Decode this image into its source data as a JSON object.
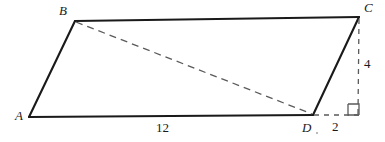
{
  "figure": {
    "type": "geometry-diagram",
    "shape": "quadrilateral",
    "canvas": {
      "width": 385,
      "height": 142
    },
    "background_color": "#ffffff",
    "stroke_color": "#1a1a1a",
    "dash_color": "#5a5a5a"
  },
  "vertices": {
    "A": {
      "label": "A",
      "x": 29,
      "y": 117,
      "label_x": 15,
      "label_y": 110
    },
    "B": {
      "label": "B",
      "x": 75,
      "y": 21,
      "label_x": 59,
      "label_y": 5
    },
    "C": {
      "label": "C",
      "x": 359,
      "y": 17,
      "label_x": 364,
      "label_y": 2
    },
    "D": {
      "label": "D",
      "x": 313,
      "y": 115,
      "label_x": 303,
      "label_y": 121
    }
  },
  "foot": {
    "x": 358,
    "y": 115
  },
  "edges": [
    {
      "name": "edge-AB",
      "from": "A",
      "to": "B",
      "style": "solid"
    },
    {
      "name": "edge-BC",
      "from": "B",
      "to": "C",
      "style": "solid"
    },
    {
      "name": "edge-CD",
      "from": "C",
      "to": "D",
      "style": "solid"
    },
    {
      "name": "edge-DA",
      "from": "D",
      "to": "A",
      "style": "solid"
    }
  ],
  "construction_lines": [
    {
      "name": "diagonal-BD",
      "from": "B",
      "to": "D",
      "style": "dashed"
    },
    {
      "name": "altitude-C-to-foot",
      "from": "C",
      "to": "foot",
      "style": "dashed"
    },
    {
      "name": "extension-D-to-foot",
      "from": "D",
      "to": "foot",
      "style": "dashed"
    }
  ],
  "measurements": {
    "base_AD": {
      "text": "12",
      "x": 156,
      "y": 121,
      "describes": "length of segment A to D"
    },
    "height_C": {
      "text": "4",
      "x": 364,
      "y": 58,
      "describes": "vertical height from C to base line"
    },
    "offset_D": {
      "text": "2",
      "x": 333,
      "y": 120,
      "describes": "horizontal offset from D to foot of altitude"
    }
  },
  "markers": {
    "right_angle": {
      "name": "right-angle-marker",
      "x": 348,
      "y": 104,
      "size": 11,
      "describes": "right angle between base extension and altitude"
    }
  }
}
